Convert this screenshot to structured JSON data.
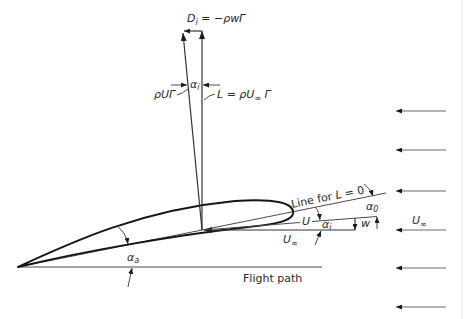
{
  "figure": {
    "background": "#ffffff",
    "stroke_color": "#151515",
    "labels": {
      "induced_drag": {
        "symbol": "D",
        "sub": "i",
        "rhs": " = −ρwΓ"
      },
      "alpha_top": {
        "symbol": "α",
        "sub": "i"
      },
      "rho_u_gamma": "ρUΓ",
      "lift": {
        "lhs": "L = ρU",
        "sub": "∞",
        "rhs": " Γ"
      },
      "line_zero_lift": {
        "text": "Line for ",
        "var": "L",
        "rhs": " = 0"
      },
      "alpha_0": {
        "symbol": "α",
        "sub": "0"
      },
      "U": "U",
      "alpha_i": {
        "symbol": "α",
        "sub": "i"
      },
      "w": "w",
      "U_inf_local": {
        "symbol": "U",
        "sub": "∞"
      },
      "U_inf_right": {
        "symbol": "U",
        "sub": "∞"
      },
      "alpha_a": {
        "symbol": "α",
        "sub": "a"
      },
      "flight_path": "Flight path"
    },
    "freestream_arrow_count": 6
  }
}
